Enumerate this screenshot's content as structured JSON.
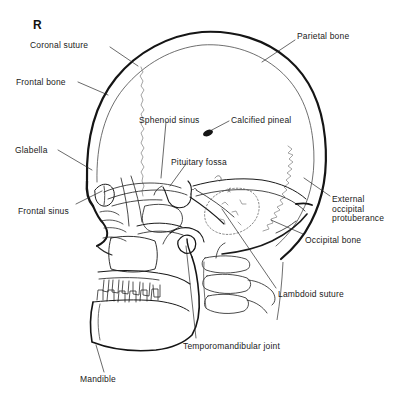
{
  "figure": {
    "type": "anatomical-line-drawing",
    "side_marker": "R",
    "background_color": "#ffffff",
    "ink_color": "#1a1a1a",
    "suture_color": "#8a8a8a",
    "canvas": {
      "width": 396,
      "height": 406
    }
  },
  "labels": [
    {
      "id": "coronal-suture",
      "text": "Coronal suture",
      "x": 30,
      "y": 41,
      "align": "left"
    },
    {
      "id": "parietal-bone",
      "text": "Parietal bone",
      "x": 297,
      "y": 32,
      "align": "left"
    },
    {
      "id": "frontal-bone",
      "text": "Frontal bone",
      "x": 16,
      "y": 78,
      "align": "left"
    },
    {
      "id": "sphenoid-sinus",
      "text": "Sphenoid sinus",
      "x": 139,
      "y": 116,
      "align": "left"
    },
    {
      "id": "calcified-pineal",
      "text": "Calcified pineal",
      "x": 231,
      "y": 116,
      "align": "left"
    },
    {
      "id": "glabella",
      "text": "Glabella",
      "x": 15,
      "y": 146,
      "align": "left"
    },
    {
      "id": "pituitary-fossa",
      "text": "Pituitary fossa",
      "x": 171,
      "y": 158,
      "align": "left"
    },
    {
      "id": "external-occipital-protuberance",
      "text": "External\noccipital\nprotuberance",
      "x": 332,
      "y": 195,
      "align": "left"
    },
    {
      "id": "frontal-sinus",
      "text": "Frontal sinus",
      "x": 18,
      "y": 207,
      "align": "left"
    },
    {
      "id": "occipital-bone",
      "text": "Occipital bone",
      "x": 305,
      "y": 236,
      "align": "left"
    },
    {
      "id": "lambdoid-suture",
      "text": "Lambdoid suture",
      "x": 278,
      "y": 290,
      "align": "left"
    },
    {
      "id": "temporomandibular-joint",
      "text": "Temporomandibular joint",
      "x": 183,
      "y": 342,
      "align": "left"
    },
    {
      "id": "mandible",
      "text": "Mandible",
      "x": 80,
      "y": 375,
      "align": "left"
    }
  ],
  "leader_lines": [
    {
      "id": "leader-coronal-suture",
      "points": "110,47 138,66"
    },
    {
      "id": "leader-parietal-bone",
      "points": "295,40 262,62"
    },
    {
      "id": "leader-frontal-bone",
      "points": "78,82 108,95"
    },
    {
      "id": "leader-sphenoid-sinus",
      "points": "166,122 161,178"
    },
    {
      "id": "leader-calcified-pineal",
      "points": "229,121 210,131"
    },
    {
      "id": "leader-glabella",
      "points": "58,150 92,170"
    },
    {
      "id": "leader-pituitary-fossa",
      "points": "186,164 170,186"
    },
    {
      "id": "leader-eop",
      "points": "330,196 304,178"
    },
    {
      "id": "leader-frontal-sinus",
      "points": "76,204 102,191"
    },
    {
      "id": "leader-occipital-bone",
      "points": "303,234 271,220"
    },
    {
      "id": "leader-lambdoid-suture",
      "points": "276,288 222,209"
    },
    {
      "id": "leader-tmj",
      "points": "196,338 186,246"
    },
    {
      "id": "leader-mandible",
      "points": "104,372 96,345"
    }
  ],
  "structures": [
    {
      "id": "outer-table-vault",
      "name": "outer table of cranial vault"
    },
    {
      "id": "inner-table-vault",
      "name": "inner table of cranial vault"
    },
    {
      "id": "coronal-suture-line",
      "name": "coronal suture"
    },
    {
      "id": "lambdoid-suture-line",
      "name": "lambdoid suture"
    },
    {
      "id": "frontal-sinus-outline",
      "name": "frontal sinus"
    },
    {
      "id": "sphenoid-sinus-outline",
      "name": "sphenoid sinus"
    },
    {
      "id": "pituitary-fossa-outline",
      "name": "sella turcica / pituitary fossa"
    },
    {
      "id": "calcified-pineal-dot",
      "name": "calcified pineal gland"
    },
    {
      "id": "petrous-temporal",
      "name": "petrous temporal bone"
    },
    {
      "id": "mastoid-air-cells",
      "name": "mastoid air cells"
    },
    {
      "id": "maxilla-teeth",
      "name": "maxilla with upper dentition"
    },
    {
      "id": "mandible-body",
      "name": "mandible with lower dentition"
    },
    {
      "id": "tmj-condyle",
      "name": "temporomandibular joint condyle"
    },
    {
      "id": "cervical-spine",
      "name": "cervical vertebrae"
    },
    {
      "id": "orbital-roof",
      "name": "orbital roof"
    },
    {
      "id": "hard-palate",
      "name": "hard palate"
    }
  ]
}
